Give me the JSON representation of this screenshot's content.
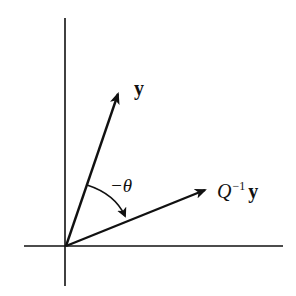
{
  "diagram": {
    "type": "vector-rotation",
    "axes": {
      "horizontal": {
        "x1": 24,
        "y1": 246,
        "x2": 283,
        "y2": 246
      },
      "vertical": {
        "x1": 65,
        "y1": 18,
        "x2": 65,
        "y2": 286
      }
    },
    "origin": {
      "x": 66,
      "y": 246
    },
    "vectors": [
      {
        "name": "y",
        "label": "y",
        "tip": {
          "x": 118,
          "y": 93
        }
      },
      {
        "name": "Q-inverse-y",
        "label_main": "Q",
        "label_sup": "−1",
        "label_vec": "y",
        "tip": {
          "x": 206,
          "y": 190
        }
      }
    ],
    "angle": {
      "label": "−θ",
      "from": "y",
      "to": "Q⁻¹y",
      "direction": "clockwise"
    },
    "colors": {
      "stroke": "#111111",
      "background": "#ffffff"
    }
  }
}
